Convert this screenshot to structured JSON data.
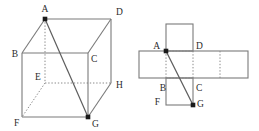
{
  "figure": {
    "panels": [
      "cube-diagram",
      "net-diagram"
    ],
    "colors": {
      "stroke": "#7a7a7a",
      "stroke_dark": "#555555",
      "label": "#2b2b2b",
      "vertex_dot": "#1a1a1a",
      "background": "#ffffff"
    },
    "line_styles": {
      "visible_edge": "solid",
      "hidden_edge": "dotted",
      "path": "solid"
    }
  },
  "cube": {
    "name": "cube-diagram",
    "vertex_labels": [
      "A",
      "B",
      "C",
      "D",
      "E",
      "F",
      "G",
      "H"
    ],
    "labels": {
      "A": "A",
      "B": "B",
      "C": "C",
      "D": "D",
      "E": "E",
      "F": "F",
      "G": "G",
      "H": "H"
    },
    "vertices": {
      "A": {
        "x": 45,
        "y": 19
      },
      "B": {
        "x": 22,
        "y": 53
      },
      "C": {
        "x": 88,
        "y": 53
      },
      "D": {
        "x": 111,
        "y": 19
      },
      "E": {
        "x": 45,
        "y": 83
      },
      "F": {
        "x": 22,
        "y": 117
      },
      "G": {
        "x": 88,
        "y": 117
      },
      "H": {
        "x": 111,
        "y": 83
      }
    },
    "label_offsets": {
      "A": {
        "x": 45,
        "y": 12
      },
      "B": {
        "x": 15,
        "y": 57
      },
      "C": {
        "x": 91,
        "y": 62
      },
      "D": {
        "x": 116,
        "y": 14
      },
      "E": {
        "x": 38,
        "y": 80
      },
      "F": {
        "x": 17,
        "y": 126
      },
      "G": {
        "x": 93,
        "y": 126
      },
      "H": {
        "x": 116,
        "y": 88
      }
    },
    "marked_vertices": [
      "A",
      "G"
    ],
    "solid_edges": [
      [
        "A",
        "B"
      ],
      [
        "A",
        "D"
      ],
      [
        "B",
        "C"
      ],
      [
        "C",
        "D"
      ],
      [
        "B",
        "F"
      ],
      [
        "C",
        "G"
      ],
      [
        "D",
        "H"
      ],
      [
        "F",
        "G"
      ],
      [
        "G",
        "H"
      ]
    ],
    "dotted_edges": [
      [
        "A",
        "E"
      ],
      [
        "E",
        "F"
      ],
      [
        "E",
        "H"
      ]
    ],
    "path_edges": [
      [
        "A",
        "G"
      ]
    ]
  },
  "net": {
    "name": "net-diagram",
    "vertex_labels": [
      "A",
      "B",
      "C",
      "D",
      "F",
      "G"
    ],
    "labels": {
      "A": "A",
      "B": "B",
      "C": "C",
      "D": "D",
      "F": "F",
      "G": "G"
    },
    "cell_size": 27,
    "grid": {
      "strip_left": 9,
      "strip_right": 118,
      "strip_top": 51,
      "strip_bottom": 78,
      "top_square": {
        "x": 36,
        "y": 24,
        "w": 27,
        "h": 27
      },
      "bottom_square": {
        "x": 36,
        "y": 78,
        "w": 27,
        "h": 27
      }
    },
    "vertices": {
      "A": {
        "x": 36,
        "y": 51
      },
      "D": {
        "x": 62,
        "y": 51
      },
      "B": {
        "x": 36,
        "y": 78
      },
      "C": {
        "x": 62,
        "y": 78
      },
      "F": {
        "x": 36,
        "y": 105
      },
      "G": {
        "x": 62,
        "y": 105
      }
    },
    "label_offsets": {
      "A": {
        "x": 30,
        "y": 48
      },
      "D": {
        "x": 66,
        "y": 48
      },
      "B": {
        "x": 32,
        "y": 90
      },
      "C": {
        "x": 66,
        "y": 90
      },
      "F": {
        "x": 30,
        "y": 103
      },
      "G": {
        "x": 66,
        "y": 106
      }
    },
    "marked_vertices": [
      "A",
      "G"
    ],
    "solid_edges": [
      [
        "strip-outline"
      ],
      [
        "top-square"
      ],
      [
        "bottom-square"
      ]
    ],
    "dotted_folds": [
      {
        "from": {
          "x": 36,
          "y": 51
        },
        "to": {
          "x": 62,
          "y": 51
        }
      },
      {
        "from": {
          "x": 36,
          "y": 78
        },
        "to": {
          "x": 62,
          "y": 78
        }
      },
      {
        "from": {
          "x": 36,
          "y": 51
        },
        "to": {
          "x": 36,
          "y": 78
        }
      },
      {
        "from": {
          "x": 62,
          "y": 51
        },
        "to": {
          "x": 62,
          "y": 78
        }
      },
      {
        "from": {
          "x": 90,
          "y": 51
        },
        "to": {
          "x": 90,
          "y": 78
        }
      }
    ],
    "path_edges": [
      [
        "A",
        "G"
      ]
    ]
  }
}
